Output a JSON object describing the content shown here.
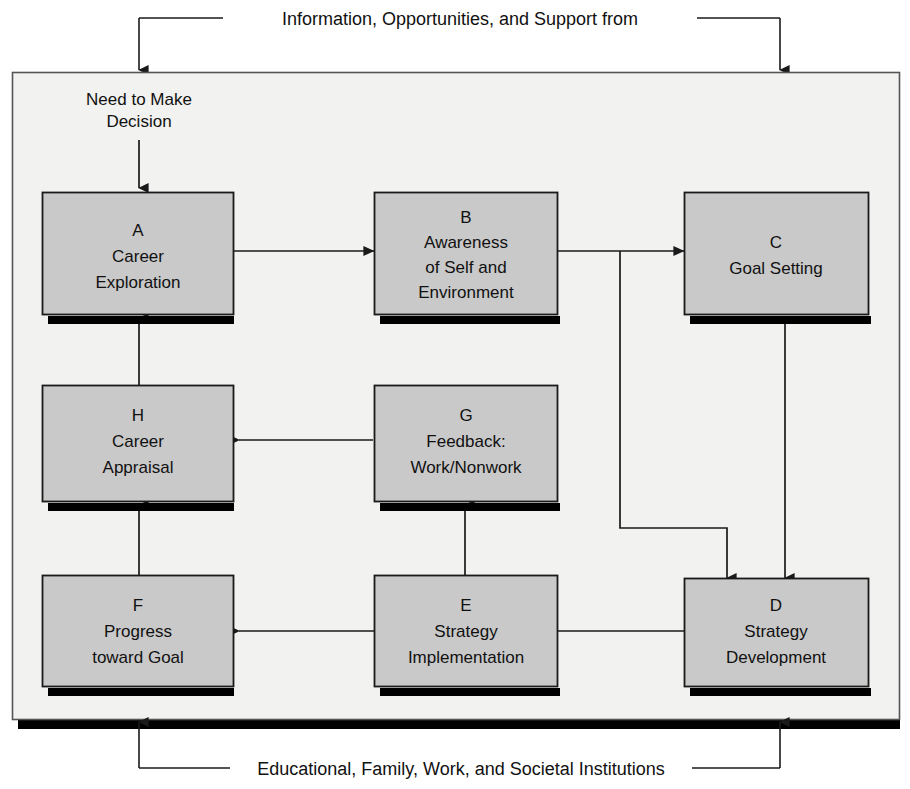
{
  "diagram": {
    "title_top": "Information, Opportunities, and Support from",
    "caption_bottom": "Educational, Family, Work, and Societal Institutions",
    "entry_label_line1": "Need to Make",
    "entry_label_line2": "Decision",
    "colors": {
      "box_fill": "#c9c9c9",
      "box_stroke": "#1a1a1a",
      "shadow": "#000000",
      "frame_fill": "#f2f2f0",
      "frame_stroke": "#555555",
      "line": "#1a1a1a",
      "page_background": "#ffffff"
    },
    "boxes": [
      {
        "id": "A",
        "letter": "A",
        "lines": [
          "Career",
          "Exploration"
        ]
      },
      {
        "id": "B",
        "letter": "B",
        "lines": [
          "Awareness",
          "of Self and",
          "Environment"
        ]
      },
      {
        "id": "C",
        "letter": "C",
        "lines": [
          "Goal Setting"
        ]
      },
      {
        "id": "D",
        "letter": "D",
        "lines": [
          "Strategy",
          "Development"
        ]
      },
      {
        "id": "E",
        "letter": "E",
        "lines": [
          "Strategy",
          "Implementation"
        ]
      },
      {
        "id": "F",
        "letter": "F",
        "lines": [
          "Progress",
          "toward Goal"
        ]
      },
      {
        "id": "G",
        "letter": "G",
        "lines": [
          "Feedback:",
          "Work/Nonwork"
        ]
      },
      {
        "id": "H",
        "letter": "H",
        "lines": [
          "Career",
          "Appraisal"
        ]
      }
    ],
    "flow_sequence": [
      "A",
      "B",
      "C",
      "D",
      "E",
      "F",
      "G",
      "H"
    ],
    "connections": [
      {
        "from": "entry",
        "to": "A"
      },
      {
        "from": "A",
        "to": "B"
      },
      {
        "from": "B",
        "to": "C"
      },
      {
        "from": "B",
        "to": "D"
      },
      {
        "from": "C",
        "to": "D"
      },
      {
        "from": "D",
        "to": "E"
      },
      {
        "from": "E",
        "to": "F"
      },
      {
        "from": "E",
        "to": "G"
      },
      {
        "from": "G",
        "to": "H"
      },
      {
        "from": "F",
        "to": "H"
      },
      {
        "from": "H",
        "to": "A"
      },
      {
        "from": "top-environment",
        "to": "frame"
      },
      {
        "from": "bottom-institutions",
        "to": "frame"
      }
    ]
  }
}
